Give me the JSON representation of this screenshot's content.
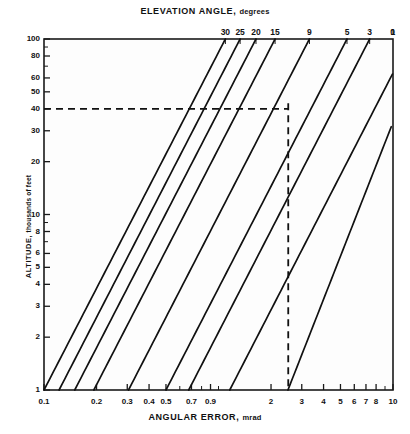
{
  "figure": {
    "top_axis_title_main": "ELEVATION ANGLE,",
    "top_axis_title_unit": "degrees",
    "bottom_axis_title_main": "ANGULAR ERROR,",
    "bottom_axis_title_unit": "mrad",
    "y_axis_title_main": "ALTITUDE,",
    "y_axis_title_unit": "thousands of feet"
  },
  "chart_data": {
    "type": "line",
    "title": "ELEVATION ANGLE, degrees",
    "xlabel": "ANGULAR ERROR, mrad",
    "ylabel": "ALTITUDE, thousands of feet",
    "xscale": "log",
    "yscale": "log",
    "xlim": [
      0.1,
      10
    ],
    "ylim": [
      1,
      100
    ],
    "grid": false,
    "legend": "top-axis-labels",
    "x_ticks_labeled": [
      "0.1",
      "0.2",
      "0.3",
      "0.4",
      "0.5",
      "0.7",
      "0.9",
      "2",
      "3",
      "4",
      "5",
      "6",
      "7",
      "8",
      "10"
    ],
    "x_tick_values": [
      0.1,
      0.2,
      0.3,
      0.4,
      0.5,
      0.7,
      0.9,
      2,
      3,
      4,
      5,
      6,
      7,
      8,
      10
    ],
    "x_ticks_minor": [
      0.6,
      0.8,
      1,
      9
    ],
    "y_ticks_labeled": [
      "1",
      "2",
      "3",
      "4",
      "5",
      "6",
      "8",
      "10",
      "20",
      "30",
      "40",
      "50",
      "60",
      "80",
      "100"
    ],
    "y_tick_values": [
      1,
      2,
      3,
      4,
      5,
      6,
      8,
      10,
      20,
      30,
      40,
      50,
      60,
      80,
      100
    ],
    "y_ticks_minor": [
      7,
      9,
      70,
      90
    ],
    "top_axis_labels": [
      "30",
      "25",
      "20",
      "15",
      "9",
      "5",
      "3",
      "1",
      "0"
    ],
    "top_axis_label_values": [
      30,
      25,
      20,
      15,
      9,
      5,
      3,
      1,
      0
    ],
    "series": [
      {
        "name": "30",
        "x_at_top": 1.095,
        "x_at_bottom": 0.1,
        "y_left": 12.0,
        "x_left": 0.1
      },
      {
        "name": "25",
        "x_at_top": 1.33,
        "x_at_bottom": 0.122,
        "y_left": 8.0,
        "x_left": 0.1
      },
      {
        "name": "20",
        "x_at_top": 1.64,
        "x_at_bottom": 0.15,
        "y_left": 6.0,
        "x_left": 0.1
      },
      {
        "name": "15",
        "x_at_top": 2.11,
        "x_at_bottom": 0.193,
        "y_left": 4.0,
        "x_left": 0.1
      },
      {
        "name": "9",
        "x_at_top": 3.32,
        "x_at_bottom": 0.305,
        "y_left": 2.45,
        "x_left": 0.1
      },
      {
        "name": "5",
        "x_at_top": 5.45,
        "x_at_bottom": 0.5,
        "y_left": 1.3,
        "x_left": 0.1
      },
      {
        "name": "3",
        "x_at_top": 7.35,
        "x_at_bottom": 0.675,
        "y_left": 1.0,
        "x_left": 0.135
      },
      {
        "name": "1",
        "x_at_top": 12.6,
        "x_at_bottom": 1.16,
        "y_left": 1.0,
        "x_left": 1.16
      },
      {
        "name": "0",
        "x_at_top": 15.4,
        "x_at_bottom": 2.5,
        "y_left": 1.0,
        "x_left": 2.5
      }
    ],
    "annotations": [
      {
        "kind": "dashed-horizontal",
        "y": 40,
        "x_from": 0.1,
        "x_to": 2.51,
        "label": "altitude 40 kft reference"
      },
      {
        "kind": "dashed-vertical",
        "x": 2.51,
        "y_from": 1,
        "y_to": 43,
        "label": "angular error reference"
      }
    ]
  }
}
